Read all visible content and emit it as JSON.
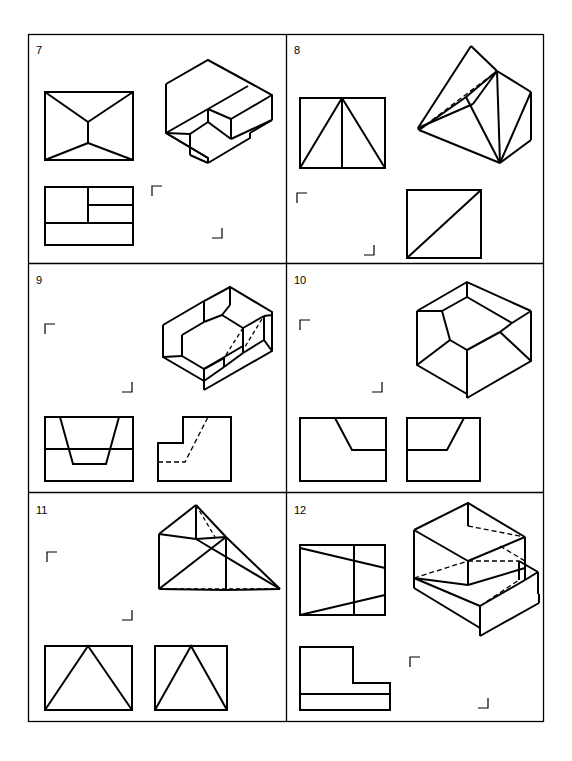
{
  "sheet": {
    "title": "Orthographic and Isometric Projection Exercise Sheet",
    "background_color": "#ffffff",
    "line_color": "#000000",
    "width": 572,
    "height": 761,
    "border": {
      "x": 28,
      "y": 34,
      "width": 516,
      "height": 688
    }
  },
  "grid": {
    "columns": 2,
    "rows": 3,
    "panel_width": 258,
    "panel_height": 229.33
  },
  "panels": [
    {
      "id": "panel-7",
      "number": "7",
      "label_pos": {
        "x": 36,
        "y": 52
      },
      "cell": {
        "x": 28,
        "y": 34,
        "width": 258,
        "height": 229
      },
      "description": "Isometric block with stepped notch; front view with chevron, top view with partitions",
      "views": [
        "front-view",
        "top-view",
        "isometric-view"
      ]
    },
    {
      "id": "panel-8",
      "number": "8",
      "label_pos": {
        "x": 294,
        "y": 52
      },
      "cell": {
        "x": 286,
        "y": 34,
        "width": 258,
        "height": 229
      },
      "description": "Wedge solid with angled faces; front view two triangles, right view square with diagonal",
      "views": [
        "front-view",
        "right-view",
        "isometric-view"
      ]
    },
    {
      "id": "panel-9",
      "number": "9",
      "label_pos": {
        "x": 36,
        "y": 282
      },
      "cell": {
        "x": 28,
        "y": 263,
        "width": 258,
        "height": 229
      },
      "description": "Block with V-shaped trough and inclined step; front view trapezoid cut, side view L with hidden line",
      "views": [
        "front-view",
        "side-view",
        "isometric-view"
      ]
    },
    {
      "id": "panel-10",
      "number": "10",
      "label_pos": {
        "x": 294,
        "y": 282
      },
      "cell": {
        "x": 286,
        "y": 263,
        "width": 258,
        "height": 229
      },
      "description": "Open box with chamfered inner corners; two orthographic views with slanted lines",
      "views": [
        "front-view",
        "side-view",
        "isometric-view"
      ]
    },
    {
      "id": "panel-11",
      "number": "11",
      "label_pos": {
        "x": 36,
        "y": 512
      },
      "cell": {
        "x": 28,
        "y": 492,
        "width": 258,
        "height": 230
      },
      "description": "Pyramid-like solid on prism; two triangular orthographic views",
      "views": [
        "front-view",
        "side-view",
        "isometric-view"
      ]
    },
    {
      "id": "panel-12",
      "number": "12",
      "label_pos": {
        "x": 294,
        "y": 512
      },
      "cell": {
        "x": 286,
        "y": 492,
        "width": 258,
        "height": 230
      },
      "description": "Stepped block with base plate; front view tapered bands, top view L-shape",
      "views": [
        "front-view",
        "top-view",
        "isometric-view"
      ]
    }
  ],
  "corner_marks": {
    "description": "small right-angle registration brackets placed in empty quadrants of each panel",
    "size": 11,
    "stroke_width": 1.2
  },
  "style": {
    "visible_line_width": 2.0,
    "hidden_line_width": 1.4,
    "hidden_dash": "5,3",
    "number_font_size": 11
  }
}
